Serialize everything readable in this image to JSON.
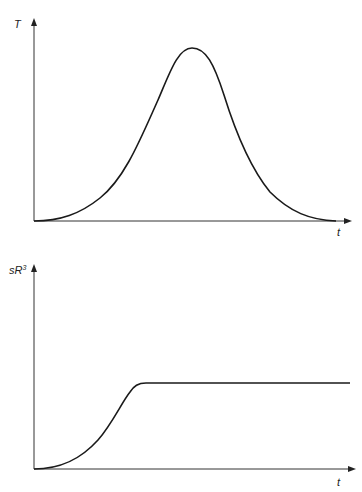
{
  "diagram": {
    "panels": [
      {
        "id": "top",
        "y_label": "T",
        "x_label": "t",
        "curve_shape": "bell-shaped peak",
        "description": "T rises from zero, reaches a single maximum, then falls back toward zero"
      },
      {
        "id": "bottom",
        "y_label_base": "sR",
        "y_label_sup": "3",
        "x_label": "t",
        "curve_shape": "rise then plateau",
        "description": "sR^3 rises from zero then saturates to a constant level"
      }
    ],
    "colors": {
      "line": "#1a1a1a",
      "axis": "#333333",
      "background": "#ffffff"
    }
  }
}
